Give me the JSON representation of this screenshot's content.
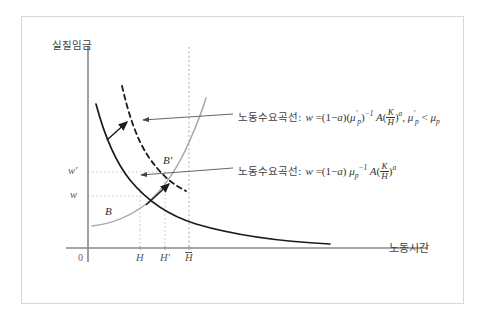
{
  "figure": {
    "type": "economics-labor-market-diagram",
    "frame_color": "#d8d8d8",
    "background": "#ffffff"
  },
  "axes": {
    "y_title": "실질임금",
    "x_title": "노동시간",
    "origin_label": "0",
    "axis_color": "#808080"
  },
  "x_ticks": [
    {
      "id": "H",
      "label": "H"
    },
    {
      "id": "Hprime",
      "label": "H'"
    },
    {
      "id": "Hbar",
      "label": "H"
    }
  ],
  "y_ticks": [
    {
      "id": "wprime",
      "label": "w'"
    },
    {
      "id": "w",
      "label": "w"
    }
  ],
  "points": [
    {
      "id": "B",
      "label": "B"
    },
    {
      "id": "Bprime",
      "label": "B'"
    }
  ],
  "annotations": [
    {
      "id": "shifted-demand",
      "curve_label": "노동수요곡선",
      "separator": ":",
      "equation": {
        "lhs": "w",
        "eq": "=",
        "term1": "(1",
        "minus": "−",
        "alpha": "a",
        "term1_close": ")",
        "mu_open": "(",
        "mu": "μ",
        "mu_prime": "'",
        "mu_sub": "p",
        "mu_close": ")",
        "mu_exp": "−1",
        "A": "A",
        "paren_open": "(",
        "frac_num": "K",
        "frac_den": "H",
        "paren_close": ")",
        "exp": "a"
      },
      "condition": {
        "mu": "μ",
        "mu_prime": "'",
        "mu_sub": "p",
        "rel": "<",
        "mu2": "μ",
        "mu2_sub": "p"
      }
    },
    {
      "id": "original-demand",
      "curve_label": "노동수요곡선",
      "separator": ":",
      "equation": {
        "lhs": "w",
        "eq": "=",
        "term1": "(1",
        "minus": "−",
        "alpha": "a",
        "term1_close": ")",
        "mu": "μ",
        "mu_sub": "p",
        "mu_exp": "−1",
        "A": "A",
        "paren_open": "(",
        "frac_num": "K",
        "frac_den": "H",
        "paren_close": ")",
        "exp": "a"
      }
    }
  ],
  "curves": [
    {
      "id": "labor-demand-original",
      "style": "solid",
      "color": "#1a1a1a"
    },
    {
      "id": "labor-demand-shifted",
      "style": "dashed",
      "color": "#1a1a1a"
    },
    {
      "id": "labor-supply",
      "style": "solid",
      "color": "#a6a6a6"
    }
  ],
  "guides": [
    {
      "id": "hbar-vertical",
      "style": "dotted",
      "color": "#b0b0b0"
    },
    {
      "id": "h-vertical",
      "style": "dotted",
      "color": "#c4c4c4"
    },
    {
      "id": "hprime-vertical",
      "style": "dotted",
      "color": "#c4c4c4"
    },
    {
      "id": "w-horizontal",
      "style": "dotted",
      "color": "#c4c4c4"
    },
    {
      "id": "wprime-horizontal",
      "style": "dotted",
      "color": "#c4c4c4"
    }
  ]
}
